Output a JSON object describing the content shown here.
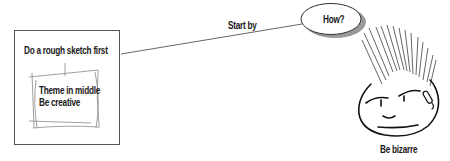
{
  "diagram": {
    "type": "mind-map",
    "nodes": {
      "central": {
        "label": "How?",
        "shape": "ellipse-with-shadow"
      },
      "sketch_box": {
        "title": "Do a rough sketch first",
        "inner_sketch": {
          "line1": "Theme in middle",
          "line2": "Be creative"
        }
      },
      "face": {
        "label": "Be bizarre",
        "illustration": "cartoon-punk-face"
      }
    },
    "edges": [
      {
        "from": "central",
        "to": "sketch_box",
        "label": "Start by"
      }
    ],
    "colors": {
      "stroke": "#1a1a1a",
      "box_border": "#555555",
      "line": "#666666",
      "shadow": "#9a9a9a",
      "sketch_line": "#888888"
    }
  }
}
